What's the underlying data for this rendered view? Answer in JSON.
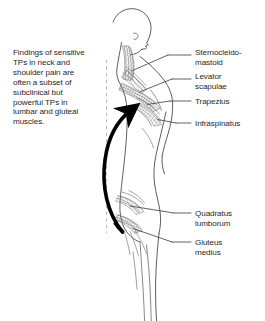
{
  "figure": {
    "caption": "Findings of sensitive\nTPs in neck and\nshoulder pain are\noften a subset of\nsubclinical but\npowerful TPs in\nlumbar and gluteal\nmuscles.",
    "arrow": {
      "name": "curved-upward-arrow",
      "meaning": "referral from lumbar/gluteal region up to neck and shoulder"
    },
    "plumb_line": {
      "name": "dashed-plumb-line",
      "style": "dashed",
      "color": "#b4b4b4"
    }
  },
  "labels": [
    {
      "id": "sternocleidomastoid",
      "text": "Sternocleido-\nmastoid"
    },
    {
      "id": "levator_scapulae",
      "text": "Levator\nscapulae"
    },
    {
      "id": "trapezius",
      "text": "Trapezius"
    },
    {
      "id": "infraspinatus",
      "text": "Infraspinatus"
    },
    {
      "id": "quadratus_lumborum",
      "text": "Quadratus\nlumborum"
    },
    {
      "id": "gluteus_medius",
      "text": "Gluteus\nmedius"
    }
  ],
  "colors": {
    "background": "#ffffff",
    "ink": "#2b2b2b",
    "text": "#1f1f1f",
    "outline": "#555555",
    "muscle_hatch": "#7a7a7a",
    "arrow": "#000000",
    "leader_line": "#3a3a3a",
    "dashed_guide": "#b4b4b4"
  }
}
